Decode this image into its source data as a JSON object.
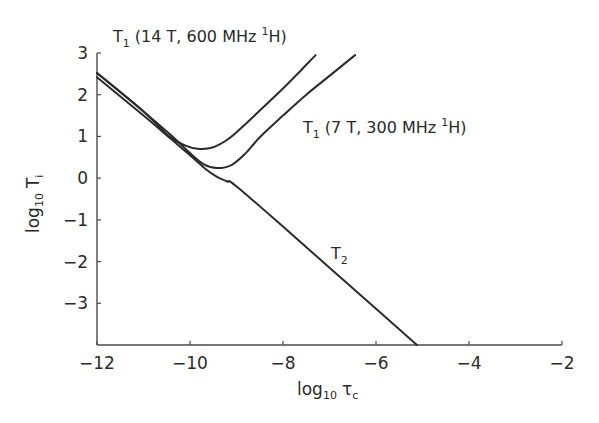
{
  "chart_data": {
    "type": "line",
    "title": "",
    "xlabel": "log10 τc",
    "ylabel": "log10 Ti",
    "xlim": [
      -12,
      -2
    ],
    "ylim": [
      -4,
      3
    ],
    "xticks": [
      -12,
      -10,
      -8,
      -6,
      -4,
      -2
    ],
    "yticks": [
      -3,
      -2,
      -1,
      0,
      1,
      2,
      3
    ],
    "grid": false,
    "legend": "inline annotations",
    "series": [
      {
        "name": "T1 (14 T, 600 MHz 1H)",
        "x": [
          -12.0,
          -11.0,
          -10.45,
          -10.1,
          -9.8,
          -9.5,
          -9.2,
          -8.9,
          -8.5,
          -8.0,
          -7.6,
          -7.3
        ],
        "y": [
          2.52,
          1.6,
          1.0,
          0.78,
          0.7,
          0.74,
          0.92,
          1.2,
          1.62,
          2.15,
          2.6,
          2.95
        ]
      },
      {
        "name": "T1 (7 T, 300 MHz 1H)",
        "x": [
          -12.0,
          -11.0,
          -10.4,
          -10.0,
          -9.7,
          -9.42,
          -9.1,
          -8.8,
          -8.5,
          -8.0,
          -7.5,
          -7.0,
          -6.45
        ],
        "y": [
          2.52,
          1.6,
          1.02,
          0.6,
          0.33,
          0.24,
          0.32,
          0.6,
          0.98,
          1.5,
          2.0,
          2.45,
          2.95
        ]
      },
      {
        "name": "T2",
        "x": [
          -12.0,
          -11.0,
          -10.4,
          -10.0,
          -9.7,
          -9.42,
          -9.2,
          -9.03,
          -8.0,
          -7.0,
          -6.0,
          -5.12
        ],
        "y": [
          2.42,
          1.5,
          0.93,
          0.55,
          0.25,
          0.03,
          -0.08,
          -0.17,
          -1.16,
          -2.15,
          -3.13,
          -4.0
        ]
      }
    ],
    "annotations": [
      {
        "text": "T1 (14 T, 600 MHz 1H)",
        "target": "T1 600 MHz curve"
      },
      {
        "text": "T1 (7 T, 300 MHz 1H)",
        "target": "T1 300 MHz curve"
      },
      {
        "text": "T2",
        "target": "T2 curve"
      }
    ]
  },
  "labels": {
    "x_axis_main": "log",
    "x_axis_sub": "10",
    "x_axis_var": "τ",
    "x_axis_var_sub": "c",
    "y_axis_main": "log",
    "y_axis_sub": "10",
    "y_axis_var": "T",
    "y_axis_var_sub": "i",
    "series_600": {
      "main": "T",
      "sub": "1",
      "rest": " (14 T, 600 MHz ",
      "sup": "1",
      "end": "H)"
    },
    "series_300": {
      "main": "T",
      "sub": "1",
      "rest": " (7 T, 300 MHz ",
      "sup": "1",
      "end": "H)"
    },
    "series_t2": {
      "main": "T",
      "sub": "2"
    }
  },
  "colors": {
    "line": "#2b2b2b",
    "axis": "#4a4a4a",
    "text": "#2a2a2a",
    "background": "#ffffff"
  }
}
